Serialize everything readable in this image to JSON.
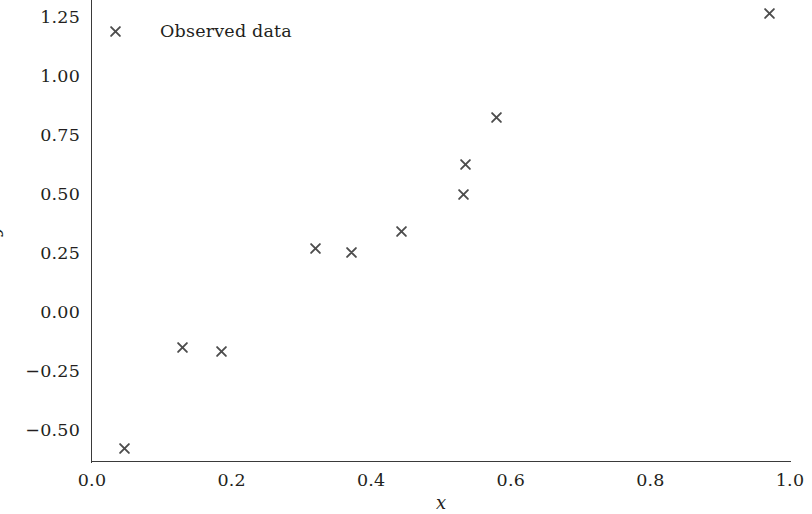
{
  "chart_data": {
    "type": "scatter",
    "title": "",
    "xlabel": "x",
    "ylabel": "y",
    "xlim": [
      0.0,
      1.0
    ],
    "ylim": [
      -0.6337,
      1.3218
    ],
    "grid": false,
    "legend_position": "upper left",
    "marker": "x",
    "marker_color": "#4d4d4d",
    "axis_color": "#3a3a3a",
    "xticks": [
      "0.0",
      "0.2",
      "0.4",
      "0.6",
      "0.8",
      "1.0"
    ],
    "xtick_values": [
      0.0,
      0.2,
      0.4,
      0.6,
      0.8,
      1.0
    ],
    "yticks": [
      "1.25",
      "1.00",
      "0.75",
      "0.50",
      "0.25",
      "0.00",
      "−0.25",
      "−0.50"
    ],
    "ytick_values": [
      1.25,
      1.0,
      0.75,
      0.5,
      0.25,
      0.0,
      -0.25,
      -0.5
    ],
    "series": [
      {
        "name": "Observed data",
        "x": [
          0.046,
          0.129,
          0.186,
          0.32,
          0.372,
          0.444,
          0.532,
          0.535,
          0.58,
          0.97
        ],
        "y": [
          -0.575,
          -0.147,
          -0.166,
          0.272,
          0.251,
          0.343,
          0.497,
          0.625,
          0.826,
          1.265
        ]
      }
    ]
  },
  "legend": {
    "entries": [
      {
        "label": "Observed data",
        "marker": "x",
        "color": "#4d4d4d"
      }
    ]
  }
}
